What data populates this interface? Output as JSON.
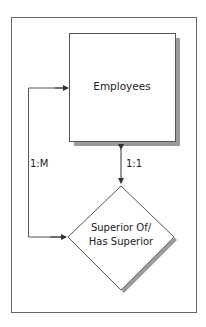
{
  "diagram": {
    "entity": {
      "label": "Employees"
    },
    "relationship": {
      "line1": "Superior Of/",
      "line2": "Has Superior"
    },
    "cardinality_left": "1:M",
    "cardinality_center": "1:1"
  },
  "colors": {
    "stroke": "#555555",
    "shadow": "#9a9a9a",
    "background": "#ffffff"
  }
}
